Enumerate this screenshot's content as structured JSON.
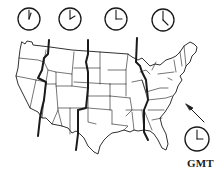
{
  "clocks": [
    {
      "zone": "pacific",
      "hour_angle": 195,
      "minute_angle": 0
    },
    {
      "zone": "mountain",
      "hour_angle": 225,
      "minute_angle": 0
    },
    {
      "zone": "central",
      "hour_angle": 270,
      "minute_angle": 0
    },
    {
      "zone": "eastern",
      "hour_angle": 315,
      "minute_angle": 0
    }
  ],
  "gmt_clock": {
    "hour_angle": 270,
    "minute_angle": 0
  },
  "gmt_label": "GMT",
  "colors": {
    "line": "#1a1a1a",
    "background": "#ffffff"
  }
}
